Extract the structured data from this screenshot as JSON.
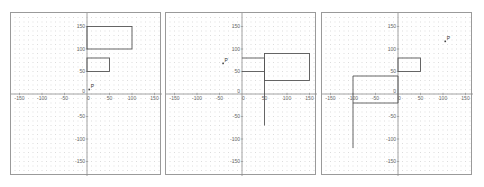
{
  "figure": {
    "panels": [
      {
        "id": "panel-1",
        "left": 10,
        "axis_ticks": [
          -150,
          -100,
          -50,
          0,
          50,
          100,
          150
        ],
        "point": {
          "label": "P",
          "x": 5,
          "y": 10
        },
        "rects": [
          {
            "x": 0,
            "y": 100,
            "w": 100,
            "h": 50
          },
          {
            "x": 0,
            "y": 50,
            "w": 50,
            "h": 30
          }
        ],
        "lines": []
      },
      {
        "id": "panel-2",
        "left": 165,
        "axis_ticks": [
          -150,
          -100,
          -50,
          0,
          50,
          100,
          150
        ],
        "point": {
          "label": "P",
          "x": -42,
          "y": 68
        },
        "rects": [
          {
            "x": 50,
            "y": 30,
            "w": 100,
            "h": 60
          }
        ],
        "lines": [
          {
            "x1": 0,
            "y1": 80,
            "x2": 50,
            "y2": 80
          },
          {
            "x1": 0,
            "y1": 50,
            "x2": 50,
            "y2": 50
          },
          {
            "x1": 50,
            "y1": 80,
            "x2": 50,
            "y2": -70
          }
        ]
      },
      {
        "id": "panel-3",
        "left": 321,
        "axis_ticks": [
          -150,
          -100,
          -50,
          0,
          50,
          100,
          150
        ],
        "point": {
          "label": "P",
          "x": 105,
          "y": 117
        },
        "rects": [
          {
            "x": 0,
            "y": 50,
            "w": 50,
            "h": 30
          }
        ],
        "lines": [
          {
            "x1": -100,
            "y1": 40,
            "x2": 0,
            "y2": 40
          },
          {
            "x1": -100,
            "y1": 40,
            "x2": -100,
            "y2": -120
          },
          {
            "x1": -100,
            "y1": -20,
            "x2": 0,
            "y2": -20
          },
          {
            "x1": 0,
            "y1": -20,
            "x2": 0,
            "y2": 40
          }
        ]
      }
    ]
  },
  "colors": {
    "grid_dot": "#c8c8c8",
    "axis": "#8c8c8c",
    "shape": "#555555",
    "border": "#9a9a9a"
  }
}
